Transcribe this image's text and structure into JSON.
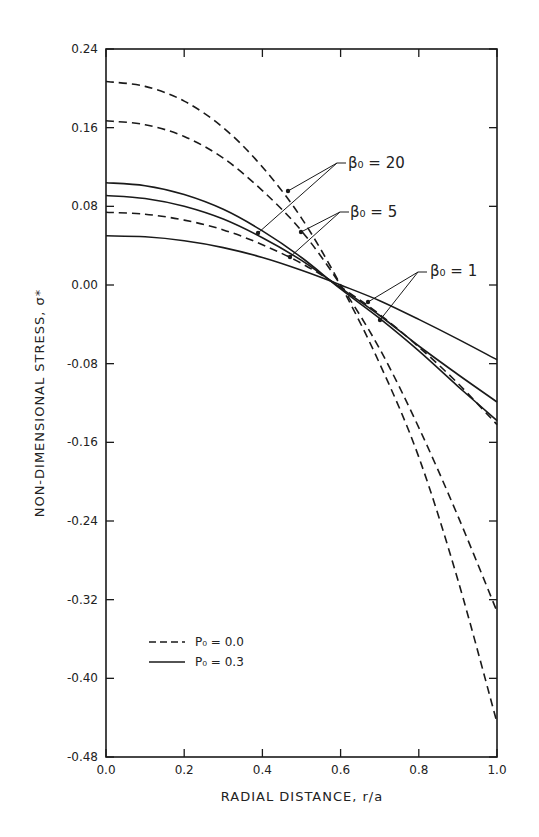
{
  "chart_data": {
    "type": "line",
    "title": "",
    "xlabel": "RADIAL DISTANCE, r/a",
    "ylabel": "NON-DIMENSIONAL STRESS, σ*",
    "xlim": [
      0.0,
      1.0
    ],
    "ylim": [
      -0.48,
      0.24
    ],
    "grid": false,
    "legend_position": "lower-left inside",
    "x_ticks": [
      "0.0",
      "0.2",
      "0.4",
      "0.6",
      "0.8",
      "1.0"
    ],
    "y_ticks": [
      "0.24",
      "0.16",
      "0.08",
      "0.00",
      "-0.08",
      "-0.16",
      "-0.24",
      "-0.32",
      "-0.40",
      "-0.48"
    ],
    "x": [
      0.0,
      0.1,
      0.2,
      0.3,
      0.4,
      0.5,
      0.6,
      0.7,
      0.8,
      0.9,
      1.0
    ],
    "series": [
      {
        "name": "P0 = 0.0, β0 = 20",
        "style": "dashed",
        "values": [
          0.207,
          0.202,
          0.187,
          0.16,
          0.12,
          0.068,
          0.0,
          -0.08,
          -0.175,
          -0.3,
          -0.445
        ]
      },
      {
        "name": "P0 = 0.0, β0 = 5",
        "style": "dashed",
        "values": [
          0.167,
          0.163,
          0.151,
          0.129,
          0.096,
          0.055,
          0.0,
          -0.065,
          -0.145,
          -0.235,
          -0.332
        ]
      },
      {
        "name": "P0 = 0.0, β0 = 1",
        "style": "dashed",
        "values": [
          0.074,
          0.072,
          0.066,
          0.056,
          0.041,
          0.022,
          -0.002,
          -0.03,
          -0.063,
          -0.1,
          -0.142
        ]
      },
      {
        "name": "P0 = 0.3, β0 = 20",
        "style": "solid",
        "values": [
          0.104,
          0.101,
          0.092,
          0.077,
          0.055,
          0.028,
          -0.004,
          -0.034,
          -0.067,
          -0.103,
          -0.138
        ]
      },
      {
        "name": "P0 = 0.3, β0 = 5",
        "style": "solid",
        "values": [
          0.091,
          0.088,
          0.08,
          0.067,
          0.048,
          0.025,
          -0.003,
          -0.031,
          -0.062,
          -0.091,
          -0.119
        ]
      },
      {
        "name": "P0 = 0.3, β0 = 1",
        "style": "solid",
        "values": [
          0.05,
          0.049,
          0.045,
          0.038,
          0.028,
          0.015,
          0.0,
          -0.016,
          -0.035,
          -0.055,
          -0.076
        ]
      }
    ],
    "legend": [
      {
        "style": "dashed",
        "label": "P₀ = 0.0"
      },
      {
        "style": "solid",
        "label": "P₀ = 0.3"
      }
    ],
    "annotations": [
      {
        "label": "β₀ = 20",
        "x": 348,
        "y": 168,
        "leader_from": [
          337,
          163
        ],
        "targets": [
          [
            288,
            191
          ],
          [
            258,
            233
          ]
        ]
      },
      {
        "label": "β₀ = 5",
        "x": 350,
        "y": 217,
        "leader_from": [
          340,
          212
        ],
        "targets": [
          [
            301,
            232
          ],
          [
            290,
            257
          ]
        ]
      },
      {
        "label": "β₀ = 1",
        "x": 430,
        "y": 276,
        "leader_from": [
          418,
          272
        ],
        "targets": [
          [
            368,
            302
          ],
          [
            380,
            320
          ]
        ]
      }
    ]
  },
  "colors": {
    "ink": "#1a1a1a",
    "background": "#ffffff"
  }
}
